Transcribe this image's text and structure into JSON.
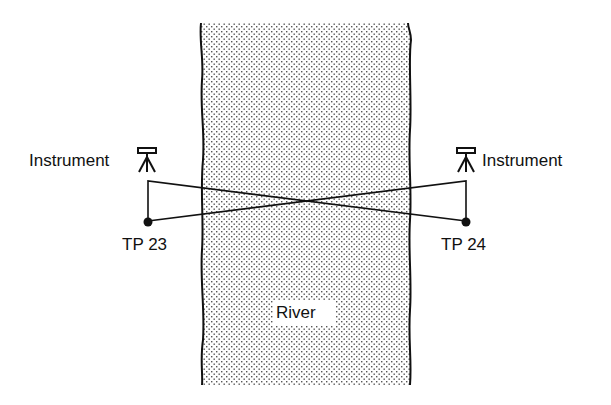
{
  "diagram": {
    "river_label": "River",
    "left": {
      "instrument_label": "Instrument",
      "tp_label": "TP 23"
    },
    "right": {
      "instrument_label": "Instrument",
      "tp_label": "TP 24"
    },
    "icons": {
      "instrument": "surveying-level-tripod-icon",
      "turning_point": "filled-dot"
    }
  }
}
